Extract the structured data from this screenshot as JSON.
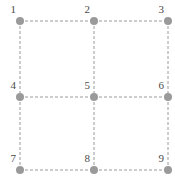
{
  "figure": {
    "type": "grid-graph",
    "width": 175,
    "height": 180,
    "background_color": "#ffffff",
    "node_color": "#9a9a9a",
    "node_radius": 4,
    "edge_color": "#9a9a9a",
    "edge_style": "dashed",
    "edge_width": 1,
    "edge_dash": "3,2",
    "label_color": "#4a4a4a",
    "label_position": "upper-left"
  },
  "chart_data": {
    "type": "scatter",
    "title": "",
    "xlabel": "",
    "ylabel": "",
    "grid": false,
    "legend": "none",
    "xlim": [
      0,
      175
    ],
    "ylim": [
      0,
      180
    ],
    "nodes": [
      {
        "id": 1,
        "label": "1",
        "x": 20,
        "y": 21,
        "row": 0,
        "col": 0
      },
      {
        "id": 2,
        "label": "2",
        "x": 94,
        "y": 21,
        "row": 0,
        "col": 1
      },
      {
        "id": 3,
        "label": "3",
        "x": 168,
        "y": 21,
        "row": 0,
        "col": 2
      },
      {
        "id": 4,
        "label": "4",
        "x": 20,
        "y": 97,
        "row": 1,
        "col": 0
      },
      {
        "id": 5,
        "label": "5",
        "x": 94,
        "y": 97,
        "row": 1,
        "col": 1
      },
      {
        "id": 6,
        "label": "6",
        "x": 168,
        "y": 97,
        "row": 1,
        "col": 2
      },
      {
        "id": 7,
        "label": "7",
        "x": 20,
        "y": 170,
        "row": 2,
        "col": 0
      },
      {
        "id": 8,
        "label": "8",
        "x": 94,
        "y": 170,
        "row": 2,
        "col": 1
      },
      {
        "id": 9,
        "label": "9",
        "x": 168,
        "y": 170,
        "row": 2,
        "col": 2
      }
    ],
    "edges": [
      {
        "from": 1,
        "to": 2
      },
      {
        "from": 2,
        "to": 3
      },
      {
        "from": 4,
        "to": 5
      },
      {
        "from": 5,
        "to": 6
      },
      {
        "from": 7,
        "to": 8
      },
      {
        "from": 8,
        "to": 9
      },
      {
        "from": 1,
        "to": 4
      },
      {
        "from": 4,
        "to": 7
      },
      {
        "from": 2,
        "to": 5
      },
      {
        "from": 5,
        "to": 8
      },
      {
        "from": 3,
        "to": 6
      },
      {
        "from": 6,
        "to": 9
      }
    ]
  }
}
